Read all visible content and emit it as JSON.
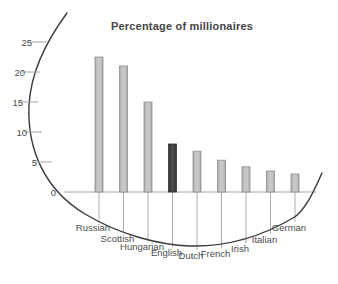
{
  "chart_data": {
    "type": "bar",
    "title": "Percentage of millionaires",
    "categories": [
      "Russian",
      "Scottish",
      "Hungarian",
      "English",
      "Dutch",
      "French",
      "Irish",
      "Italian",
      "German"
    ],
    "values": [
      22.5,
      21,
      15,
      8,
      6.8,
      5.3,
      4.2,
      3.5,
      3
    ],
    "highlight_index": 3,
    "xlabel": "",
    "ylabel": "",
    "yticks": [
      0,
      5,
      10,
      15,
      20,
      25
    ],
    "ylim": [
      0,
      26
    ],
    "grid": false,
    "legend": "none",
    "colors": {
      "bar_fill": "#bcbcbc",
      "bar_edge": "#8f8f8f",
      "bar_highlight_fill": "#424242",
      "bar_highlight_edge": "#333333",
      "axis_line": "#a5a5a5",
      "curve": "#3a3a3a",
      "text": "#4c4c4c"
    }
  }
}
